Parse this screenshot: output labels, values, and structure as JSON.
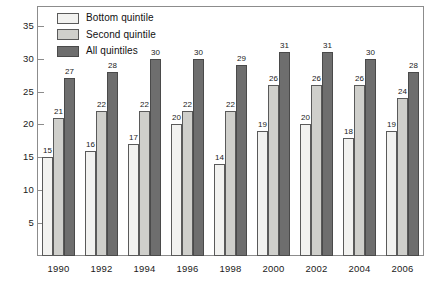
{
  "chart_data": {
    "type": "bar",
    "title": "",
    "subtitle": "",
    "xlabel": "",
    "ylabel": "",
    "categories": [
      "1990",
      "1992",
      "1994",
      "1996",
      "1998",
      "2000",
      "2002",
      "2004",
      "2006"
    ],
    "series": [
      {
        "name": "Bottom quintile",
        "color": "#f2f2f0",
        "values": [
          15,
          16,
          17,
          20,
          14,
          19,
          20,
          18,
          19
        ]
      },
      {
        "name": "Second quintile",
        "color": "#cfcfcb",
        "values": [
          21,
          22,
          22,
          22,
          22,
          26,
          26,
          26,
          24
        ]
      },
      {
        "name": "All quintiles",
        "color": "#6e6e6e",
        "values": [
          27,
          28,
          30,
          30,
          29,
          31,
          31,
          30,
          28
        ]
      }
    ],
    "ylim": [
      0,
      38
    ],
    "yticks": [
      5,
      10,
      15,
      20,
      25,
      30,
      35
    ],
    "ytick_labels": [
      "5",
      "10",
      "15",
      "20",
      "25",
      "30",
      "35"
    ],
    "grid": false,
    "data_labels": true,
    "legend_position": "top-left"
  },
  "legend": {
    "items": [
      {
        "label": "Bottom quintile"
      },
      {
        "label": "Second quintile"
      },
      {
        "label": "All quintiles"
      }
    ]
  }
}
